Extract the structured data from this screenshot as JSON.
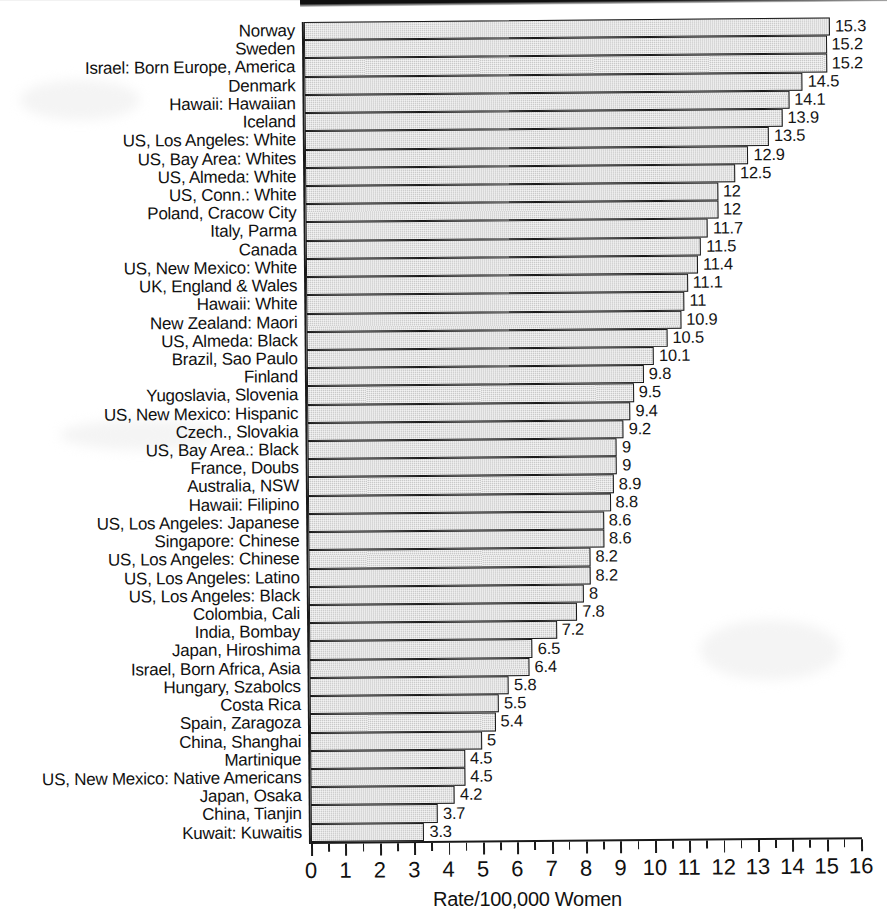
{
  "chart_data": {
    "type": "bar",
    "orientation": "horizontal",
    "title": "",
    "xlabel": "Rate/100,000 Women",
    "ylabel": "",
    "xlim": [
      0,
      16
    ],
    "xticks": [
      0,
      1,
      2,
      3,
      4,
      5,
      6,
      7,
      8,
      9,
      10,
      11,
      12,
      13,
      14,
      15,
      16
    ],
    "xtick_labels": [
      "0",
      "1",
      "2",
      "3",
      "4",
      "5",
      "6",
      "7",
      "8",
      "9",
      "10",
      "11",
      "12",
      "13",
      "14",
      "15",
      "16"
    ],
    "grid": false,
    "legend": null,
    "bar_fill_color": "#c9c9c9",
    "bar_edge_color": "#1a1a1a",
    "categories": [
      "Norway",
      "Sweden",
      "Israel: Born Europe, America",
      "Denmark",
      "Hawaii: Hawaiian",
      "Iceland",
      "US, Los Angeles: White",
      "US, Bay Area: Whites",
      "US, Almeda: White",
      "US, Conn.: White",
      "Poland, Cracow City",
      "Italy, Parma",
      "Canada",
      "US, New Mexico: White",
      "UK, England & Wales",
      "Hawaii: White",
      "New Zealand: Maori",
      "US, Almeda: Black",
      "Brazil, Sao Paulo",
      "Finland",
      "Yugoslavia, Slovenia",
      "US, New Mexico: Hispanic",
      "Czech., Slovakia",
      "US, Bay Area.: Black",
      "France, Doubs",
      "Australia, NSW",
      "Hawaii: Filipino",
      "US, Los Angeles: Japanese",
      "Singapore: Chinese",
      "US, Los Angeles: Chinese",
      "US, Los Angeles: Latino",
      "US, Los Angeles: Black",
      "Colombia, Cali",
      "India, Bombay",
      "Japan, Hiroshima",
      "Israel, Born Africa, Asia",
      "Hungary, Szabolcs",
      "Costa Rica",
      "Spain, Zaragoza",
      "China, Shanghai",
      "Martinique",
      "US, New Mexico: Native Americans",
      "Japan, Osaka",
      "China, Tianjin",
      "Kuwait: Kuwaitis"
    ],
    "values": [
      15.3,
      15.2,
      15.2,
      14.5,
      14.1,
      13.9,
      13.5,
      12.9,
      12.5,
      12,
      12,
      11.7,
      11.5,
      11.4,
      11.1,
      11,
      10.9,
      10.5,
      10.1,
      9.8,
      9.5,
      9.4,
      9.2,
      9,
      9,
      8.9,
      8.8,
      8.6,
      8.6,
      8.2,
      8.2,
      8,
      7.8,
      7.2,
      6.5,
      6.4,
      5.8,
      5.5,
      5.4,
      5,
      4.5,
      4.5,
      4.2,
      3.7,
      3.3
    ],
    "value_labels": [
      "15.3",
      "15.2",
      "15.2",
      "14.5",
      "14.1",
      "13.9",
      "13.5",
      "12.9",
      "12.5",
      "12",
      "12",
      "11.7",
      "11.5",
      "11.4",
      "11.1",
      "11",
      "10.9",
      "10.5",
      "10.1",
      "9.8",
      "9.5",
      "9.4",
      "9.2",
      "9",
      "9",
      "8.9",
      "8.8",
      "8.6",
      "8.6",
      "8.2",
      "8.2",
      "8",
      "7.8",
      "7.2",
      "6.5",
      "6.4",
      "5.8",
      "5.5",
      "5.4",
      "5",
      "4.5",
      "4.5",
      "4.2",
      "3.7",
      "3.3"
    ]
  }
}
